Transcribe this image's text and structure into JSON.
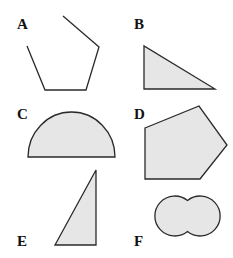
{
  "figure": {
    "shapes": [
      {
        "label": "A",
        "kind": "open pentagon outline",
        "fill": "none"
      },
      {
        "label": "B",
        "kind": "right triangle",
        "fill": "#e6e6e6"
      },
      {
        "label": "C",
        "kind": "semicircle",
        "fill": "#e6e6e6"
      },
      {
        "label": "D",
        "kind": "pentagon",
        "fill": "#e6e6e6"
      },
      {
        "label": "E",
        "kind": "right triangle",
        "fill": "#e6e6e6"
      },
      {
        "label": "F",
        "kind": "two overlapping circles",
        "fill": "#e6e6e6"
      }
    ],
    "colors": {
      "stroke": "#2a2a2a",
      "fill": "#e6e6e6",
      "background": "#ffffff"
    }
  }
}
